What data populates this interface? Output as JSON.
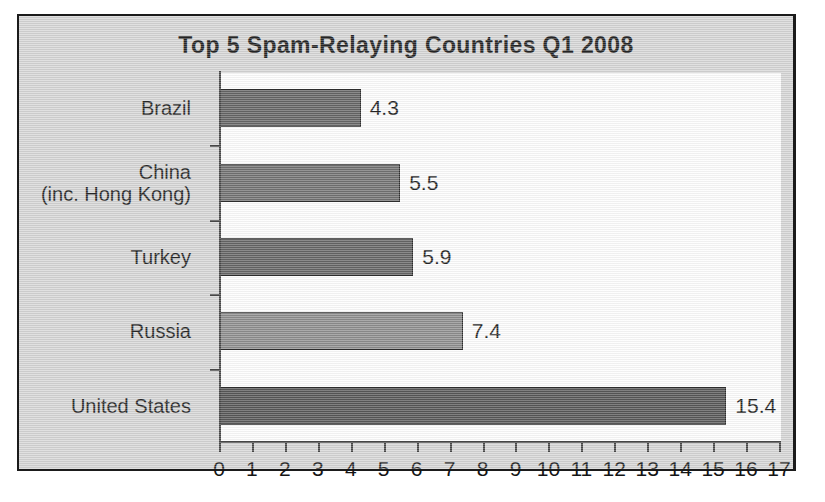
{
  "chart_data": {
    "type": "bar",
    "orientation": "horizontal",
    "title": "Top 5 Spam-Relaying Countries Q1 2008",
    "xlabel": "",
    "ylabel": "",
    "xlim": [
      0,
      17
    ],
    "grid": false,
    "legend": "none",
    "categories": [
      "Brazil",
      "China (inc. Hong Kong)",
      "Turkey",
      "Russia",
      "United States"
    ],
    "values": [
      4.3,
      5.5,
      5.9,
      7.4,
      15.4
    ],
    "value_labels": [
      "4.3",
      "5.5",
      "5.9",
      "7.4",
      "15.4"
    ],
    "bar_colors": [
      "#595959",
      "#666666",
      "#595959",
      "#858585",
      "#4a4a4a"
    ],
    "xticks": [
      0,
      1,
      2,
      3,
      4,
      5,
      6,
      7,
      8,
      9,
      10,
      11,
      12,
      13,
      14,
      15,
      16,
      17
    ],
    "xtick_labels": [
      "0",
      "1",
      "2",
      "3",
      "4",
      "5",
      "6",
      "7",
      "8",
      "9",
      "10",
      "11",
      "12",
      "13",
      "14",
      "15",
      "16",
      "17"
    ],
    "category_label_lines": [
      [
        "Brazil"
      ],
      [
        "China",
        "(inc. Hong Kong)"
      ],
      [
        "Turkey"
      ],
      [
        "Russia"
      ],
      [
        "United States"
      ]
    ]
  },
  "figure": {
    "background_color": "#d3d3d3",
    "plot_background_color": "#fdfdfd",
    "border_color": "#1b1b1b",
    "axis_color": "#3a3a3a",
    "text_color": "#141414"
  }
}
